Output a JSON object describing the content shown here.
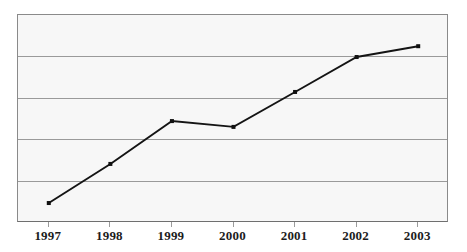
{
  "chart_data": {
    "type": "line",
    "title": "",
    "subtitle": "",
    "xlabel": "",
    "ylabel": "",
    "categories": [
      "1997",
      "1998",
      "1999",
      "2000",
      "2001",
      "2002",
      "2003"
    ],
    "series": [
      {
        "name": "Series 1",
        "values": [
          0.48,
          1.42,
          2.45,
          2.31,
          3.15,
          3.99,
          4.25
        ],
        "color": "#141414",
        "marker": "square"
      }
    ],
    "ylim": [
      0,
      5
    ],
    "xlim_categories": 7,
    "yticklabels": [],
    "xticklabels": [
      "1997",
      "1998",
      "1999",
      "2000",
      "2001",
      "2002",
      "2003"
    ],
    "gridlines": {
      "horizontal": true,
      "vertical": false,
      "count": 6,
      "y_values": [
        0,
        1,
        2,
        3,
        4,
        5
      ],
      "color": "#9a9a9a"
    },
    "legend": {
      "visible": false,
      "position": "none",
      "entries": []
    },
    "annotations": [],
    "plot_background": "#f7f7f7",
    "figure_background": "#ffffff",
    "border_color": "#8a8a8a"
  },
  "axis": {
    "x_tick_count": 7
  }
}
